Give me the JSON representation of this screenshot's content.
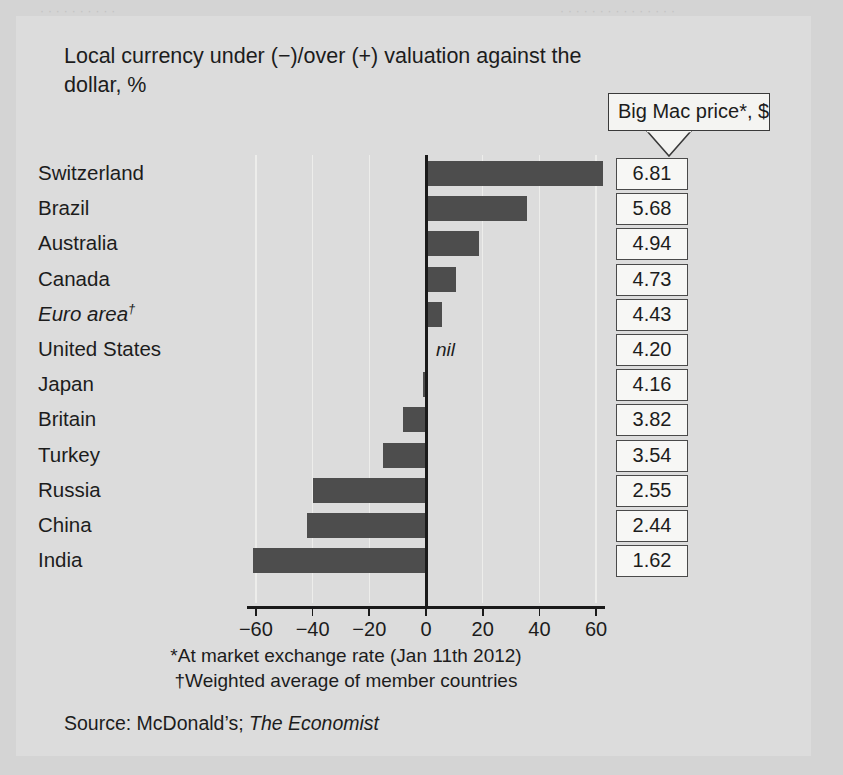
{
  "chart_title": "Local currency under (−)/over (+) valuation against the dollar, %",
  "callout": {
    "label": "Big Mac price*, $"
  },
  "axis": {
    "ticks": [
      "−60",
      "−40",
      "−20",
      "0",
      "20",
      "40",
      "60"
    ],
    "tick_values": [
      -60,
      -40,
      -20,
      0,
      20,
      40,
      60
    ],
    "min": -70,
    "max": 70
  },
  "nil_label": "nil",
  "footnotes": {
    "line1": "*At market exchange rate (Jan 11th 2012)",
    "line2": "†Weighted average of member countries"
  },
  "source": {
    "prefix": "Source: McDonald’s; ",
    "publication": "The Economist"
  },
  "colors": {
    "panel_background": "#dcdcdc",
    "page_background": "#d4d4d4",
    "bar_fill": "#4d4d4d",
    "axis": "#1a1a1a",
    "gridline": "#ededeb",
    "price_box_background": "#f7f7f5",
    "text": "#1c1c1c"
  },
  "ghost_text": [
    {
      "text": "· · · · · · · · · · · · · · ·",
      "x": 560,
      "y": 4
    },
    {
      "text": "· · · · · · · · · ·",
      "x": 40,
      "y": 4
    }
  ],
  "chart_data": {
    "type": "bar",
    "orientation": "horizontal",
    "title": "Local currency under (−)/over (+) valuation against the dollar, %",
    "xlabel": "",
    "ylabel": "",
    "xlim": [
      -70,
      70
    ],
    "grid": true,
    "legend": "none",
    "categories": [
      "Switzerland",
      "Brazil",
      "Australia",
      "Canada",
      "Euro area†",
      "United States",
      "Japan",
      "Britain",
      "Turkey",
      "Russia",
      "China",
      "India"
    ],
    "values": [
      62,
      35,
      18,
      10,
      5,
      0,
      -1,
      -8,
      -15,
      -40,
      -42,
      -61
    ],
    "series": [
      {
        "name": "Local currency under/over valuation vs dollar, %",
        "values": [
          62,
          35,
          18,
          10,
          5,
          0,
          -1,
          -8,
          -15,
          -40,
          -42,
          -61
        ]
      },
      {
        "name": "Big Mac price*, $",
        "values": [
          6.81,
          5.68,
          4.94,
          4.73,
          4.43,
          4.2,
          4.16,
          3.82,
          3.54,
          2.55,
          2.44,
          1.62
        ]
      }
    ],
    "rows": [
      {
        "country": "Switzerland",
        "italic": false,
        "dagger": false,
        "valuation": 62,
        "price": "6.81"
      },
      {
        "country": "Brazil",
        "italic": false,
        "dagger": false,
        "valuation": 35,
        "price": "5.68"
      },
      {
        "country": "Australia",
        "italic": false,
        "dagger": false,
        "valuation": 18,
        "price": "4.94"
      },
      {
        "country": "Canada",
        "italic": false,
        "dagger": false,
        "valuation": 10,
        "price": "4.73"
      },
      {
        "country": "Euro area",
        "italic": true,
        "dagger": true,
        "valuation": 5,
        "price": "4.43"
      },
      {
        "country": "United States",
        "italic": false,
        "dagger": false,
        "valuation": 0,
        "price": "4.20"
      },
      {
        "country": "Japan",
        "italic": false,
        "dagger": false,
        "valuation": -1,
        "price": "4.16"
      },
      {
        "country": "Britain",
        "italic": false,
        "dagger": false,
        "valuation": -8,
        "price": "3.82"
      },
      {
        "country": "Turkey",
        "italic": false,
        "dagger": false,
        "valuation": -15,
        "price": "3.54"
      },
      {
        "country": "Russia",
        "italic": false,
        "dagger": false,
        "valuation": -40,
        "price": "2.55"
      },
      {
        "country": "China",
        "italic": false,
        "dagger": false,
        "valuation": -42,
        "price": "2.44"
      },
      {
        "country": "India",
        "italic": false,
        "dagger": false,
        "valuation": -61,
        "price": "1.62"
      }
    ],
    "annotations": [
      {
        "text": "nil",
        "at_category": "United States",
        "at_value": 0
      }
    ]
  }
}
